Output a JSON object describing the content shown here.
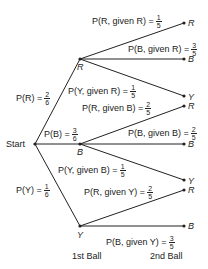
{
  "start_label": "Start",
  "level1": [
    {
      "node": "R",
      "prob_label": "P(R) =",
      "num": "2",
      "den": "6"
    },
    {
      "node": "B",
      "prob_label": "P(B) =",
      "num": "3",
      "den": "6"
    },
    {
      "node": "Y",
      "prob_label": "P(Y) =",
      "num": "1",
      "den": "6"
    }
  ],
  "level2": {
    "R": [
      {
        "node": "R",
        "prob_label": "P(R, given R) =",
        "num": "1",
        "den": "5"
      },
      {
        "node": "B",
        "prob_label": "P(B, given R) =",
        "num": "3",
        "den": "5"
      },
      {
        "node": "Y",
        "prob_label": "P(Y, given R) =",
        "num": "1",
        "den": "5"
      }
    ],
    "B": [
      {
        "node": "R",
        "prob_label": "P(R, given B) =",
        "num": "2",
        "den": "5"
      },
      {
        "node": "B",
        "prob_label": "P(B, given B) =",
        "num": "2",
        "den": "5"
      },
      {
        "node": "Y",
        "prob_label": "P(Y, given B) =",
        "num": "1",
        "den": "5"
      }
    ],
    "Y": [
      {
        "node": "R",
        "prob_label": "P(R, given Y) =",
        "num": "2",
        "den": "5"
      },
      {
        "node": "B",
        "prob_label": "P(B, given Y) =",
        "num": "3",
        "den": "5"
      }
    ]
  },
  "axis_labels": {
    "first": "1st Ball",
    "second": "2nd Ball"
  }
}
